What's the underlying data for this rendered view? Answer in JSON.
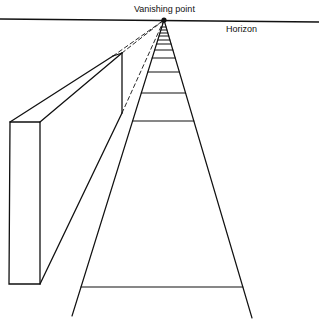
{
  "labels": {
    "vanishing_point": "Vanishing point",
    "horizon": "Horizon"
  },
  "colors": {
    "ink": "#111111",
    "background": "#ffffff"
  },
  "geometry": {
    "vanishing_point": [
      164,
      20
    ],
    "horizon": {
      "x1": 0,
      "y1": 19,
      "x2": 319,
      "y2": 22
    },
    "road_left_end": [
      72,
      316
    ],
    "road_right_end": [
      252,
      318
    ],
    "road_stripes_y": [
      27,
      30,
      33,
      36,
      40,
      44,
      50,
      58,
      72,
      93,
      121,
      287
    ],
    "wall": {
      "front_face": [
        [
          10,
          122
        ],
        [
          40,
          122
        ],
        [
          40,
          284
        ],
        [
          9,
          284
        ]
      ],
      "top_back_outer": [
        113,
        56
      ],
      "top_back_inner": [
        122,
        53
      ],
      "back_edge_bottom": [
        122,
        113
      ]
    }
  }
}
